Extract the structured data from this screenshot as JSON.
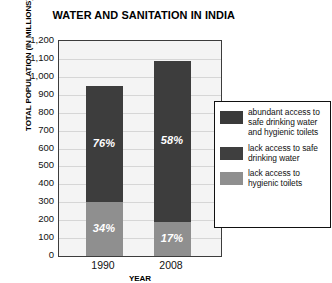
{
  "chart_data": {
    "type": "bar",
    "subtype": "stacked",
    "title": "WATER AND SANITATION IN INDIA",
    "xlabel": "YEAR",
    "ylabel": "TOTAL POPULATION (IN MILLIONS)",
    "categories": [
      "1990",
      "2008"
    ],
    "ylim": [
      0,
      1200
    ],
    "yticks": [
      "0",
      "100",
      "200",
      "300",
      "400",
      "500",
      "600",
      "700",
      "800",
      "900",
      "1,000",
      "1,100",
      "1,200"
    ],
    "ytick_values": [
      0,
      100,
      200,
      300,
      400,
      500,
      600,
      700,
      800,
      900,
      1000,
      1100,
      1200
    ],
    "grid": true,
    "legend_position": "right",
    "series": [
      {
        "name": "lack access to hygienic toilets",
        "color": "#8f8f8f",
        "values": [
          300,
          190
        ],
        "labels": [
          "34%",
          "17%"
        ]
      },
      {
        "name": "lack access to safe drinking water",
        "color": "#3d3d3d",
        "values": [
          650,
          900
        ],
        "labels": [
          "76%",
          "58%"
        ]
      }
    ],
    "bar_totals": [
      950,
      1090
    ],
    "legend": [
      {
        "label": "abundant access to safe drinking water and hygienic toilets",
        "color": "#3a3a3a"
      },
      {
        "label": "lack access to safe drinking water",
        "color": "#3f3f3f"
      },
      {
        "label": "lack access to hygienic toilets",
        "color": "#8f8f8f"
      }
    ]
  },
  "colors": {
    "dark": "#3d3d3d",
    "light": "#8f8f8f",
    "plot_background": "#f4f4f4",
    "grid": "#d6d6d6",
    "frame": "#3c3c3c"
  }
}
